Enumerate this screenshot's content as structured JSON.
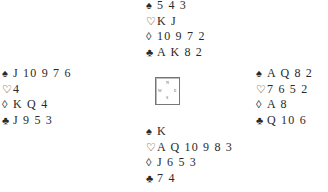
{
  "suits": {
    "spades": "♠",
    "hearts": "♡",
    "diamonds": "◊",
    "clubs": "♣"
  },
  "hands": {
    "north": {
      "spades": "5 4 3",
      "hearts": "K J",
      "diamonds": "10 9 7 2",
      "clubs": "A K 8 2"
    },
    "west": {
      "spades": "J 10 9 7 6",
      "hearts": "4",
      "diamonds": "K Q 4",
      "clubs": "J 9 5 3"
    },
    "east": {
      "spades": "A Q 8 2",
      "hearts": "7 6 5 2",
      "diamonds": "A 8",
      "clubs": "Q 10 6"
    },
    "south": {
      "spades": "K",
      "hearts": "A Q 10 9 8 3",
      "diamonds": "J 6 5 3",
      "clubs": "7 4"
    }
  },
  "compass": {
    "n": "N",
    "s": "S",
    "w": "W",
    "e": "E"
  }
}
